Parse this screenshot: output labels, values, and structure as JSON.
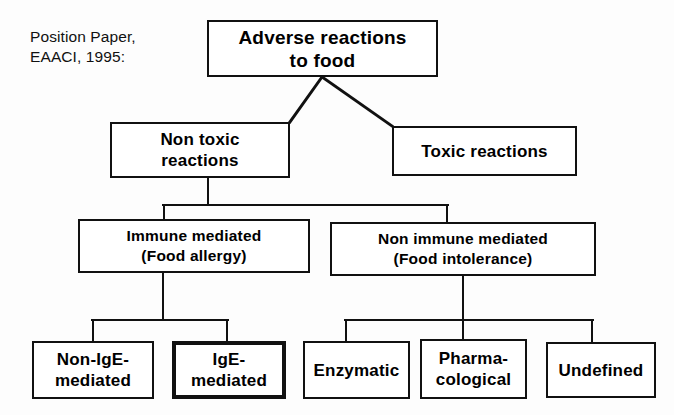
{
  "caption": {
    "text": "Position Paper,\nEAACI, 1995:"
  },
  "colors": {
    "ink": "#111111",
    "paper": "#ffffff"
  },
  "diagram": {
    "nodes": {
      "root": {
        "label": "Adverse  reactions\nto food"
      },
      "non_toxic": {
        "label": "Non toxic\nreactions"
      },
      "toxic": {
        "label": "Toxic reactions"
      },
      "immune_mediated": {
        "label": "Immune mediated\n(Food allergy)"
      },
      "non_immune_mediated": {
        "label": "Non immune mediated\n(Food  intolerance)"
      },
      "non_ige": {
        "label": "Non-IgE-\nmediated"
      },
      "ige": {
        "label": "IgE-\nmediated"
      },
      "enzymatic": {
        "label": "Enzymatic"
      },
      "pharmacological": {
        "label": "Pharma-\ncological"
      },
      "undefined": {
        "label": "Undefined"
      }
    }
  }
}
